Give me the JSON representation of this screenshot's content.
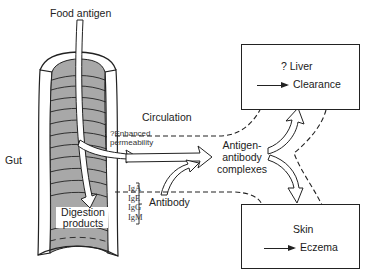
{
  "diagram": {
    "type": "flow-diagram",
    "title": "",
    "labels": {
      "food_antigen": "Food antigen",
      "gut": "Gut",
      "circulation": "Circulation",
      "enhanced_permeability_line1": "?Enhanced",
      "enhanced_permeability_line2": "permeability",
      "digestion_products_line1": "Digestion",
      "digestion_products_line2": "products",
      "antibody": "Antibody",
      "antibody_classes": [
        "IgA",
        "IgE",
        "IgG",
        "IgM"
      ],
      "complexes_line1": "Antigen-",
      "complexes_line2": "antibody",
      "complexes_line3": "complexes"
    },
    "boxes": {
      "liver": {
        "title": "? Liver",
        "outcome": "Clearance"
      },
      "skin": {
        "title": "Skin",
        "outcome": "Eczema"
      }
    },
    "edges": [
      {
        "from": "Food antigen",
        "to": "Digestion products",
        "style": "hollow-arrow"
      },
      {
        "from": "Gut",
        "to": "Antigen-antibody complexes",
        "style": "hollow-arrow",
        "label": "?Enhanced permeability"
      },
      {
        "from": "Antibody",
        "to": "Antigen-antibody complexes",
        "style": "hollow-arrow"
      },
      {
        "from": "Antigen-antibody complexes",
        "to": "Liver",
        "style": "hollow-arrow"
      },
      {
        "from": "Antigen-antibody complexes",
        "to": "Skin",
        "style": "hollow-arrow"
      },
      {
        "from": "Gut",
        "to": "Liver",
        "style": "dashed",
        "label": "Circulation"
      },
      {
        "from": "Gut",
        "to": "Skin",
        "style": "dashed"
      },
      {
        "from": "Liver",
        "to": "Skin",
        "style": "dashed"
      }
    ],
    "colors": {
      "gut_fill": "#a8a8a8",
      "gut_wall": "#ffffff",
      "stroke": "#222222",
      "background": "#ffffff"
    }
  }
}
